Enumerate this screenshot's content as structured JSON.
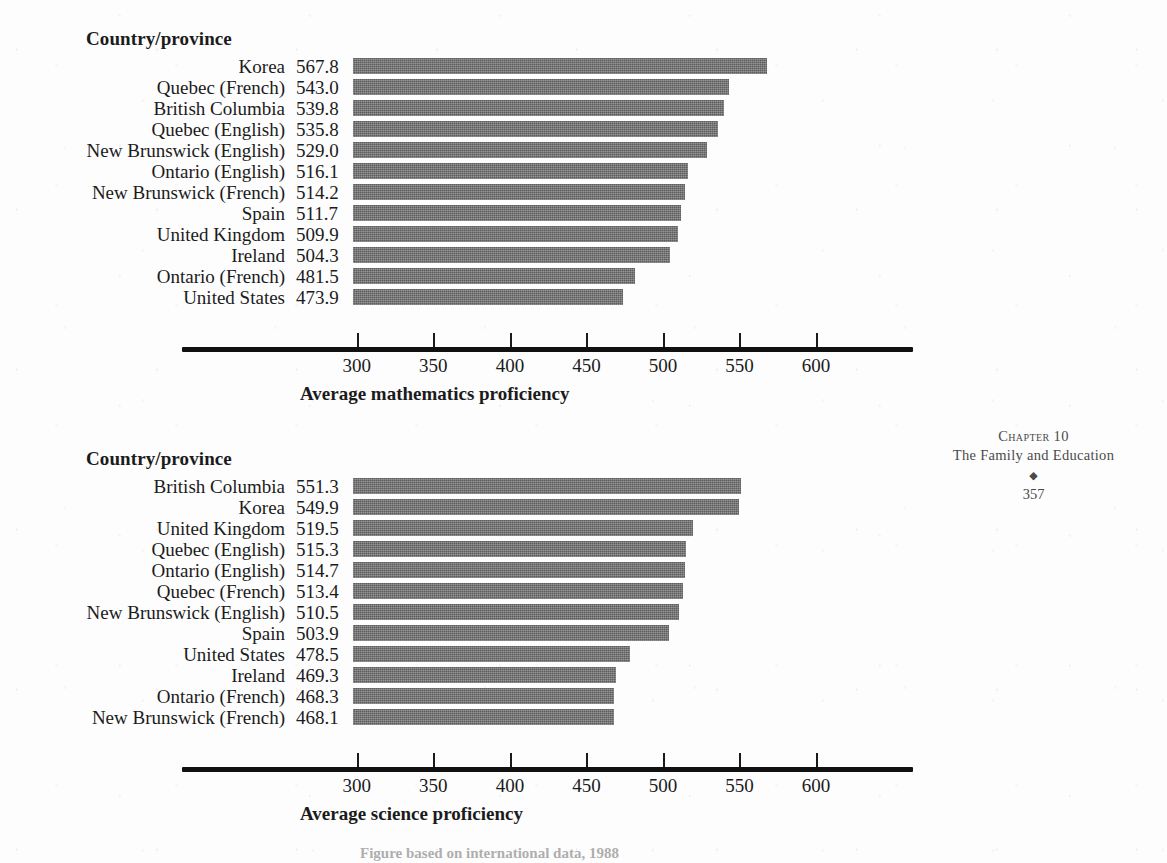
{
  "page": {
    "running_head": {
      "chapter": "Chapter 10",
      "title": "The Family and Education",
      "ornament": "◆",
      "page_number": "357"
    },
    "bottom_caption": "Figure based on international data, 1988"
  },
  "charts": [
    {
      "id": "mathematics",
      "column_header": "Country/province",
      "axis_caption": "Average mathematics proficiency",
      "chart_data": {
        "type": "bar",
        "orientation": "horizontal",
        "title": "",
        "xlabel": "Average mathematics proficiency",
        "ylabel": "Country/province",
        "xlim": [
          297.5,
          635
        ],
        "ticks": [
          300,
          350,
          400,
          450,
          500,
          550,
          600
        ],
        "grid": false,
        "legend": "none",
        "categories": [
          "Korea",
          "Quebec (French)",
          "British Columbia",
          "Quebec (English)",
          "New Brunswick (English)",
          "Ontario (English)",
          "New Brunswick (French)",
          "Spain",
          "United Kingdom",
          "Ireland",
          "Ontario (French)",
          "United States"
        ],
        "values": [
          567.8,
          543.0,
          539.8,
          535.8,
          529.0,
          516.1,
          514.2,
          511.7,
          509.9,
          504.3,
          481.5,
          473.9
        ],
        "value_labels": [
          "567.8",
          "543.0",
          "539.8",
          "535.8",
          "529.0",
          "516.1",
          "514.2",
          "511.7",
          "509.9",
          "504.3",
          "481.5",
          "473.9"
        ]
      }
    },
    {
      "id": "science",
      "column_header": "Country/province",
      "axis_caption": "Average science proficiency",
      "chart_data": {
        "type": "bar",
        "orientation": "horizontal",
        "title": "",
        "xlabel": "Average science proficiency",
        "ylabel": "Country/province",
        "xlim": [
          297.5,
          635
        ],
        "ticks": [
          300,
          350,
          400,
          450,
          500,
          550,
          600
        ],
        "grid": false,
        "legend": "none",
        "categories": [
          "British Columbia",
          "Korea",
          "United Kingdom",
          "Quebec (English)",
          "Ontario (English)",
          "Quebec (French)",
          "New Brunswick (English)",
          "Spain",
          "United States",
          "Ireland",
          "Ontario (French)",
          "New Brunswick (French)"
        ],
        "values": [
          551.3,
          549.9,
          519.5,
          515.3,
          514.7,
          513.4,
          510.5,
          503.9,
          478.5,
          469.3,
          468.3,
          468.1
        ],
        "value_labels": [
          "551.3",
          "549.9",
          "519.5",
          "515.3",
          "514.7",
          "513.4",
          "510.5",
          "503.9",
          "478.5",
          "469.3",
          "468.3",
          "468.1"
        ]
      }
    }
  ]
}
